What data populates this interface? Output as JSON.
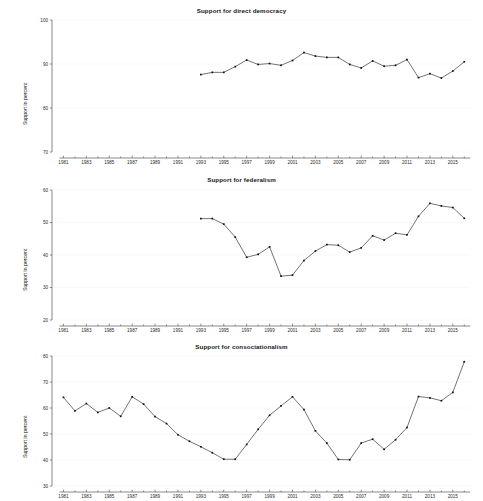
{
  "figure": {
    "ylabel": "Support in percent",
    "n_panels": 3
  },
  "chart_data": [
    {
      "type": "line",
      "title": "Support for direct democracy",
      "xlabel": "",
      "ylabel": "Support in percent",
      "ylim": [
        70,
        100
      ],
      "xlim": [
        1980,
        2016.5
      ],
      "yticks": [
        70,
        80,
        90,
        100
      ],
      "xticks": [
        1981,
        1983,
        1985,
        1987,
        1989,
        1991,
        1993,
        1995,
        1997,
        1999,
        2001,
        2003,
        2005,
        2007,
        2009,
        2011,
        2013,
        2015
      ],
      "grid": false,
      "legend": "none",
      "marker": "square",
      "x": [
        1993,
        1994,
        1995,
        1996,
        1997,
        1998,
        1999,
        2000,
        2001,
        2002,
        2003,
        2004,
        2005,
        2006,
        2007,
        2008,
        2009,
        2010,
        2011,
        2012,
        2013,
        2014,
        2015,
        2016
      ],
      "values": [
        87.6,
        88.1,
        88.1,
        89.4,
        90.9,
        89.9,
        90.1,
        89.7,
        90.8,
        92.6,
        91.8,
        91.5,
        91.5,
        89.9,
        89.1,
        90.7,
        89.5,
        89.7,
        91.0,
        86.9,
        87.8,
        86.8,
        88.4,
        90.5
      ]
    },
    {
      "type": "line",
      "title": "Support for federalism",
      "xlabel": "",
      "ylabel": "Support in percent",
      "ylim": [
        20,
        60
      ],
      "xlim": [
        1980,
        2016.5
      ],
      "yticks": [
        20,
        30,
        40,
        50,
        60
      ],
      "xticks": [
        1981,
        1983,
        1985,
        1987,
        1989,
        1991,
        1993,
        1995,
        1997,
        1999,
        2001,
        2003,
        2005,
        2007,
        2009,
        2011,
        2013,
        2015
      ],
      "grid": false,
      "legend": "none",
      "marker": "square",
      "x": [
        1993,
        1994,
        1995,
        1996,
        1997,
        1998,
        1999,
        2000,
        2001,
        2002,
        2003,
        2004,
        2005,
        2006,
        2007,
        2008,
        2009,
        2010,
        2011,
        2012,
        2013,
        2014,
        2015,
        2016
      ],
      "values": [
        51.2,
        51.2,
        49.5,
        45.5,
        39.3,
        40.2,
        42.5,
        33.5,
        33.8,
        38.3,
        41.2,
        43.2,
        43.0,
        40.9,
        42.2,
        45.9,
        44.6,
        46.7,
        46.2,
        51.9,
        55.9,
        55.1,
        54.6,
        51.3
      ]
    },
    {
      "type": "line",
      "title": "Support for consociationalism",
      "xlabel": "",
      "ylabel": "Support in percent",
      "ylim": [
        30,
        80
      ],
      "xlim": [
        1980,
        2016.5
      ],
      "yticks": [
        30,
        40,
        50,
        60,
        70,
        80
      ],
      "xticks": [
        1981,
        1983,
        1985,
        1987,
        1989,
        1991,
        1993,
        1995,
        1997,
        1999,
        2001,
        2003,
        2005,
        2007,
        2009,
        2011,
        2013,
        2015
      ],
      "grid": false,
      "legend": "none",
      "marker": "square",
      "x": [
        1981,
        1982,
        1983,
        1984,
        1985,
        1986,
        1987,
        1988,
        1989,
        1990,
        1991,
        1992,
        1993,
        1994,
        1995,
        1996,
        1997,
        1998,
        1999,
        2000,
        2001,
        2002,
        2003,
        2004,
        2005,
        2006,
        2007,
        2008,
        2009,
        2010,
        2011,
        2012,
        2013,
        2014,
        2015,
        2016
      ],
      "values": [
        64.1,
        58.9,
        61.7,
        58.3,
        60.0,
        56.8,
        64.3,
        61.5,
        56.7,
        54.0,
        49.7,
        47.2,
        45.1,
        42.8,
        40.3,
        40.3,
        46.0,
        51.8,
        57.2,
        60.8,
        64.3,
        59.4,
        51.2,
        46.5,
        40.2,
        40.1,
        46.5,
        48.0,
        44.1,
        47.8,
        52.5,
        64.4,
        63.9,
        62.8,
        66.0,
        77.8
      ]
    }
  ]
}
